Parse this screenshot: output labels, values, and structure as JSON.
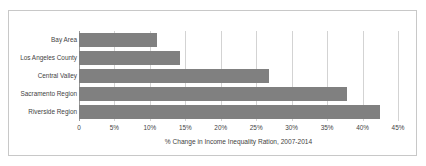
{
  "chart_data": {
    "type": "bar",
    "orientation": "horizontal",
    "title": "",
    "subtitle": "",
    "xlabel": "% Change in Income Inequality Ration, 2007-2014",
    "ylabel": "",
    "categories": [
      "Bay Area",
      "Los Angeles County",
      "Central Valley",
      "Sacramento Region",
      "Riverside Region"
    ],
    "values": [
      11.0,
      14.3,
      26.8,
      37.8,
      42.4
    ],
    "series": [
      {
        "name": "% Change in Income Inequality Ratio",
        "values": [
          11.0,
          14.3,
          26.8,
          37.8,
          42.4
        ]
      }
    ],
    "xlim": [
      0,
      45
    ],
    "ylim": null,
    "xticks": [
      0,
      5,
      10,
      15,
      20,
      25,
      30,
      35,
      40,
      45
    ],
    "xtick_labels": [
      "0",
      "5%",
      "10%",
      "15%",
      "20%",
      "25%",
      "30%",
      "35%",
      "40%",
      "45%"
    ],
    "grid": "vertical",
    "legend": "none",
    "bar_color": "#808080",
    "gridline_color": "#d3d3d3",
    "axis_color": "#9a9a9a",
    "border_color": "#c8c8c8",
    "background_color": "#ffffff",
    "annotations": []
  }
}
